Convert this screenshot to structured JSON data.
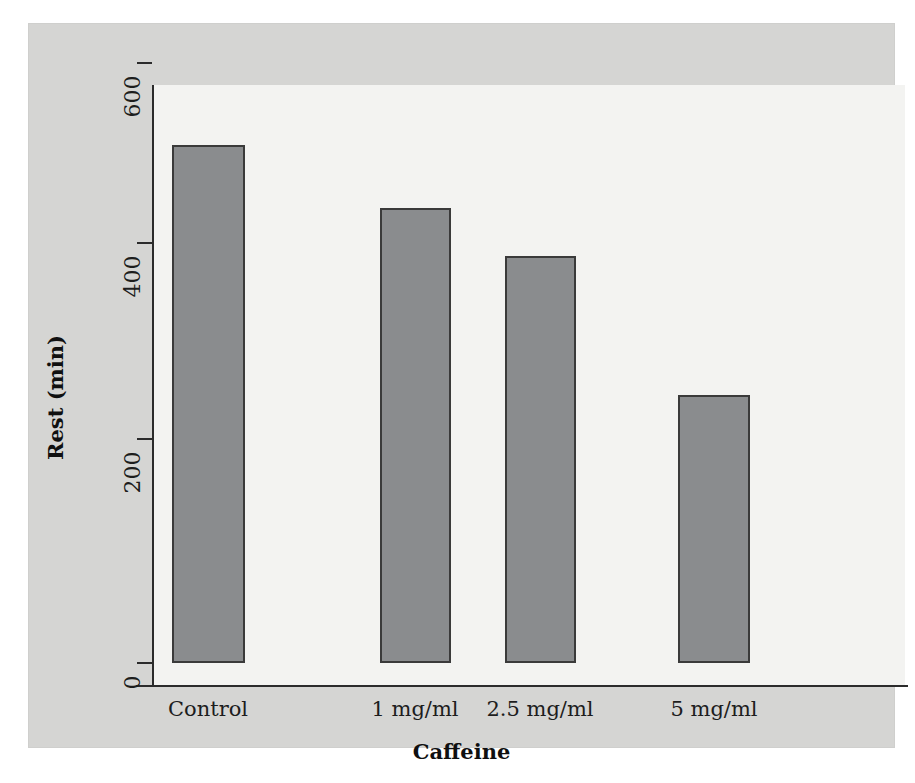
{
  "chart_data": {
    "type": "bar",
    "title": "",
    "xlabel": "Caffeine",
    "ylabel": "Rest (min)",
    "categories": [
      "Control",
      "1 mg/ml",
      "2.5 mg/ml",
      "5 mg/ml"
    ],
    "values": [
      518,
      455,
      407,
      268
    ],
    "ylim": [
      0,
      600
    ],
    "yticks": [
      0,
      200,
      400,
      600
    ],
    "ytick_labels": [
      "0",
      "200",
      "400",
      "600"
    ],
    "xlim_categories": 4,
    "grid": false,
    "legend": false,
    "bar_color": "#8a8c8e",
    "bar_edge_color": "#3a3a3a",
    "plot_background": "#f3f3f1",
    "panel_background": "#d5d5d3",
    "axis_color": "#2b2b2b"
  },
  "axis": {
    "y_title": "Rest (min)",
    "x_title": "Caffeine",
    "y_ticks": [
      {
        "label": "600",
        "value": 600
      },
      {
        "label": "400",
        "value": 400
      },
      {
        "label": "200",
        "value": 200
      },
      {
        "label": "0",
        "value": 0
      }
    ],
    "x_ticks": [
      {
        "label": "Control"
      },
      {
        "label": "1 mg/ml"
      },
      {
        "label": "2.5 mg/ml"
      },
      {
        "label": "5 mg/ml"
      }
    ]
  },
  "bars": [
    {
      "label": "Control",
      "value": 518
    },
    {
      "label": "1 mg/ml",
      "value": 455
    },
    {
      "label": "2.5 mg/ml",
      "value": 407
    },
    {
      "label": "5 mg/ml",
      "value": 268
    }
  ]
}
